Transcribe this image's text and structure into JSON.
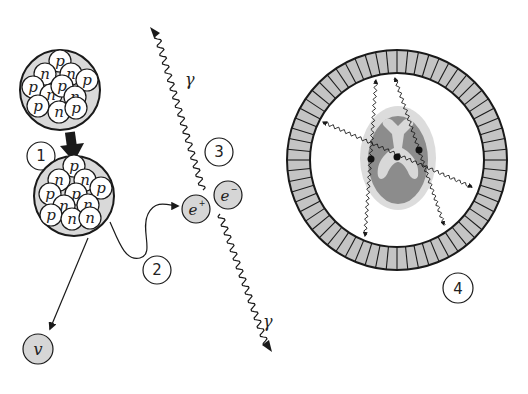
{
  "diagram": {
    "colors": {
      "stroke": "#1a1a1a",
      "nucleus_fill": "#d9d9d9",
      "particle_fill": "#d6d6d6",
      "nucleon_fill": "#ffffff",
      "detector_fill": "#c4c4c4",
      "head_outer": "#dcdcdc",
      "head_inner": "#8c8c8c",
      "head_ventricle": "#d8d8d8"
    },
    "steps": [
      {
        "id": "1",
        "label": "1"
      },
      {
        "id": "2",
        "label": "2"
      },
      {
        "id": "3",
        "label": "3"
      },
      {
        "id": "4",
        "label": "4"
      }
    ],
    "nucleus_before": {
      "nucleons": [
        "p",
        "n",
        "n",
        "p",
        "p",
        "n",
        "p",
        "n",
        "p",
        "n",
        "p"
      ]
    },
    "nucleus_after": {
      "nucleons": [
        "p",
        "n",
        "n",
        "p",
        "p",
        "n",
        "n",
        "p",
        "n",
        "n"
      ]
    },
    "particles": {
      "positron": "e",
      "positron_sign": "+",
      "electron": "e",
      "electron_sign": "−",
      "neutrino": "v"
    },
    "gamma_top": "γ",
    "gamma_bottom": "γ",
    "detector_ring": {
      "segments": 64
    }
  }
}
